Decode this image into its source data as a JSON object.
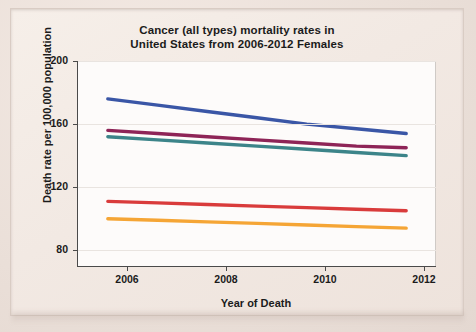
{
  "chart_data": {
    "type": "line",
    "title": "Cancer (all types) mortality rates in United States from 2006-2012 Females",
    "title_line1": "Cancer (all types) mortality rates in",
    "title_line2": "United States from 2006-2012 Females",
    "xlabel": "Year of Death",
    "ylabel": "Death rate per 100,000 population",
    "x": [
      2006,
      2007,
      2008,
      2009,
      2010,
      2011,
      2012
    ],
    "xticks": [
      2006,
      2008,
      2010,
      2012
    ],
    "yticks": [
      80,
      120,
      160,
      200
    ],
    "xlim": [
      2005.4,
      2012.6
    ],
    "ylim": [
      70,
      200
    ],
    "grid": true,
    "legend": "none",
    "series": [
      {
        "name": "series-1-blue",
        "color": "#3a56a6",
        "values": [
          176,
          172,
          168,
          164,
          160,
          157,
          154
        ]
      },
      {
        "name": "series-2-purple",
        "color": "#8e2457",
        "values": [
          156,
          154,
          152,
          150,
          148,
          146,
          145
        ]
      },
      {
        "name": "series-3-teal",
        "color": "#3c8489",
        "values": [
          152,
          150,
          148,
          146,
          144,
          142,
          140
        ]
      },
      {
        "name": "series-4-red",
        "color": "#d93b3b",
        "values": [
          111,
          110,
          109,
          108,
          107,
          106,
          105
        ]
      },
      {
        "name": "series-5-orange",
        "color": "#f5a535",
        "values": [
          100,
          99,
          98,
          97,
          96,
          95,
          94
        ]
      }
    ]
  },
  "axis": {
    "ytick_labels": [
      "200",
      "160",
      "120",
      "80"
    ],
    "xtick_labels": [
      "2006",
      "2008",
      "2010",
      "2012"
    ]
  }
}
